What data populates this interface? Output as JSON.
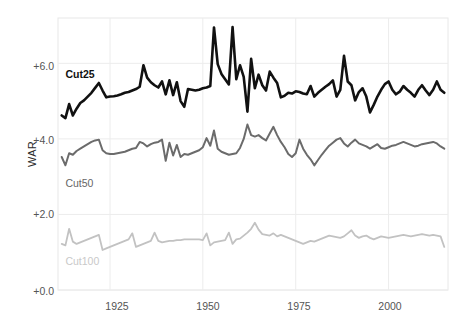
{
  "chart_data": {
    "type": "line",
    "title": "",
    "xlabel": "",
    "ylabel": "WAR",
    "xlim": [
      1911,
      2016
    ],
    "ylim": [
      0.0,
      7.2
    ],
    "grid": true,
    "legend_position": "inline-labels",
    "xticks": [
      "1925",
      "1950",
      "1975",
      "2000"
    ],
    "xtick_values": [
      1925,
      1950,
      1975,
      2000
    ],
    "yticks": [
      "+0.0",
      "+2.0",
      "+4.0",
      "+6.0"
    ],
    "ytick_values": [
      0.0,
      2.0,
      4.0,
      6.0
    ],
    "x": [
      1912,
      1913,
      1914,
      1915,
      1916,
      1917,
      1918,
      1919,
      1920,
      1921,
      1922,
      1923,
      1924,
      1925,
      1926,
      1927,
      1928,
      1929,
      1930,
      1931,
      1932,
      1933,
      1934,
      1935,
      1936,
      1937,
      1938,
      1939,
      1940,
      1941,
      1942,
      1943,
      1944,
      1945,
      1946,
      1947,
      1948,
      1949,
      1950,
      1951,
      1952,
      1953,
      1954,
      1955,
      1956,
      1957,
      1958,
      1959,
      1960,
      1961,
      1962,
      1963,
      1964,
      1965,
      1966,
      1967,
      1968,
      1969,
      1970,
      1971,
      1972,
      1973,
      1974,
      1975,
      1976,
      1977,
      1978,
      1979,
      1980,
      1981,
      1982,
      1983,
      1984,
      1985,
      1986,
      1987,
      1988,
      1989,
      1990,
      1991,
      1992,
      1993,
      1994,
      1995,
      1996,
      1997,
      1998,
      1999,
      2000,
      2001,
      2002,
      2003,
      2004,
      2005,
      2006,
      2007,
      2008,
      2009,
      2010,
      2011,
      2012,
      2013,
      2014,
      2015
    ],
    "series": [
      {
        "name": "Cut25",
        "color": "#111111",
        "width": 2.6,
        "values": [
          4.62,
          4.55,
          4.92,
          4.62,
          4.8,
          4.95,
          5.02,
          5.12,
          5.22,
          5.35,
          5.48,
          5.28,
          5.1,
          5.12,
          5.13,
          5.15,
          5.18,
          5.22,
          5.24,
          5.28,
          5.32,
          5.38,
          5.95,
          5.62,
          5.5,
          5.42,
          5.36,
          5.52,
          5.18,
          5.55,
          5.16,
          5.5,
          5.0,
          4.85,
          5.32,
          5.3,
          5.28,
          5.3,
          5.34,
          5.36,
          5.4,
          6.95,
          5.98,
          5.72,
          5.58,
          5.44,
          6.96,
          5.58,
          5.95,
          5.64,
          4.72,
          6.12,
          5.34,
          5.7,
          5.42,
          5.28,
          5.78,
          5.62,
          5.48,
          5.1,
          5.14,
          5.22,
          5.2,
          5.26,
          5.24,
          5.2,
          5.18,
          5.4,
          5.12,
          5.22,
          5.3,
          5.38,
          5.45,
          5.55,
          5.12,
          5.3,
          6.2,
          5.52,
          5.42,
          5.02,
          5.24,
          5.34,
          5.12,
          4.7,
          4.9,
          5.12,
          5.3,
          5.45,
          5.52,
          5.3,
          5.18,
          5.25,
          5.4,
          5.3,
          5.22,
          5.12,
          5.3,
          5.42,
          5.28,
          5.16,
          5.3,
          5.52,
          5.3,
          5.22
        ]
      },
      {
        "name": "Cut50",
        "color": "#6b6b6b",
        "width": 2.0,
        "values": [
          3.52,
          3.3,
          3.62,
          3.58,
          3.68,
          3.74,
          3.8,
          3.86,
          3.92,
          3.96,
          3.98,
          3.7,
          3.62,
          3.6,
          3.6,
          3.62,
          3.64,
          3.66,
          3.7,
          3.74,
          3.76,
          3.92,
          3.88,
          3.8,
          3.86,
          3.9,
          3.92,
          3.98,
          3.42,
          3.9,
          3.56,
          3.84,
          3.52,
          3.6,
          3.58,
          3.62,
          3.66,
          3.7,
          3.78,
          4.02,
          3.82,
          4.22,
          3.74,
          3.66,
          3.62,
          3.58,
          3.6,
          3.62,
          3.76,
          4.0,
          4.38,
          4.1,
          4.06,
          4.1,
          4.02,
          3.96,
          4.14,
          4.32,
          4.1,
          3.92,
          3.78,
          3.6,
          3.52,
          3.62,
          3.98,
          3.74,
          3.58,
          3.46,
          3.3,
          3.44,
          3.58,
          3.7,
          3.82,
          3.9,
          3.98,
          4.02,
          3.88,
          3.8,
          3.9,
          3.98,
          3.88,
          3.84,
          3.8,
          3.74,
          3.8,
          3.86,
          3.76,
          3.74,
          3.78,
          3.82,
          3.84,
          3.88,
          3.92,
          3.88,
          3.84,
          3.8,
          3.82,
          3.86,
          3.88,
          3.9,
          3.92,
          3.88,
          3.8,
          3.74
        ]
      },
      {
        "name": "Cut100",
        "color": "#c2c2c2",
        "width": 1.8,
        "values": [
          1.22,
          1.18,
          1.62,
          1.28,
          1.22,
          1.26,
          1.3,
          1.34,
          1.38,
          1.42,
          1.46,
          1.06,
          1.1,
          1.14,
          1.18,
          1.22,
          1.26,
          1.3,
          1.34,
          1.5,
          1.14,
          1.18,
          1.22,
          1.26,
          1.3,
          1.52,
          1.3,
          1.26,
          1.28,
          1.3,
          1.3,
          1.32,
          1.32,
          1.34,
          1.34,
          1.34,
          1.34,
          1.34,
          1.32,
          1.5,
          1.18,
          1.26,
          1.28,
          1.3,
          1.32,
          1.52,
          1.22,
          1.34,
          1.36,
          1.44,
          1.52,
          1.62,
          1.78,
          1.6,
          1.48,
          1.46,
          1.44,
          1.5,
          1.42,
          1.46,
          1.42,
          1.38,
          1.34,
          1.3,
          1.26,
          1.22,
          1.26,
          1.3,
          1.28,
          1.32,
          1.36,
          1.4,
          1.44,
          1.42,
          1.4,
          1.38,
          1.42,
          1.5,
          1.58,
          1.44,
          1.38,
          1.42,
          1.44,
          1.38,
          1.34,
          1.38,
          1.42,
          1.4,
          1.38,
          1.4,
          1.42,
          1.44,
          1.46,
          1.44,
          1.42,
          1.44,
          1.46,
          1.48,
          1.46,
          1.44,
          1.46,
          1.44,
          1.42,
          1.14
        ]
      }
    ],
    "annotations": [
      {
        "text": "Cut25",
        "x": 1913,
        "y": 5.72,
        "series": "Cut25"
      },
      {
        "text": "Cut50",
        "x": 1913,
        "y": 2.82,
        "series": "Cut50"
      },
      {
        "text": "Cut100",
        "x": 1913,
        "y": 0.78,
        "series": "Cut100"
      }
    ]
  },
  "style": {
    "background": "#ffffff",
    "grid_color": "#ececec",
    "axis_text_color": "#555555",
    "ylabel_color": "#2b2b2b"
  }
}
